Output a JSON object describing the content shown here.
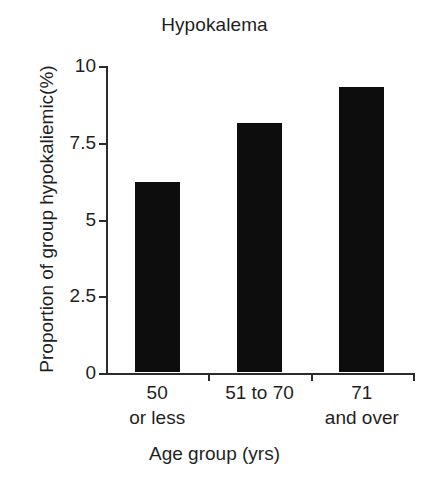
{
  "chart_data": {
    "type": "bar",
    "title": "Hypokalema",
    "xlabel": "Age group (yrs)",
    "ylabel": "Proportion of group hypokaliemic(%)",
    "categories": [
      "50 or less",
      "51 to 70",
      "71 and over"
    ],
    "category_lines": [
      {
        "line1": "50",
        "line2": "or less"
      },
      {
        "line1": "51 to 70",
        "line2": ""
      },
      {
        "line1": "71",
        "line2": "and over"
      }
    ],
    "values": [
      6.2,
      8.1,
      9.3
    ],
    "ylim": [
      0,
      10
    ],
    "yticks": [
      0,
      2.5,
      5,
      7.5,
      10
    ],
    "ytick_labels": [
      "0",
      "2.5",
      "5",
      "7.5",
      "10"
    ],
    "grid": false,
    "legend": null,
    "bar_color": "#0d0d0d",
    "axis_color": "#2b2b2b",
    "background_color": "#ffffff"
  }
}
